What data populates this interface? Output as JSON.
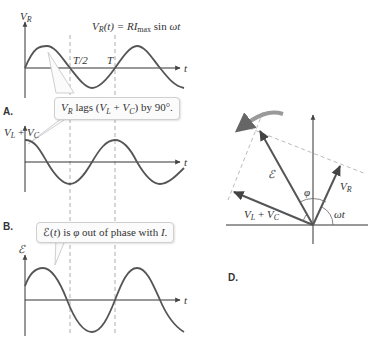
{
  "panels": {
    "A": {
      "label": "A.",
      "y_axis_label": "V_R",
      "equation": "V_R(t) = RI_max sin ωt",
      "tick_half_period": "T/2",
      "tick_period": "T",
      "x_axis_label": "t"
    },
    "B": {
      "label": "B.",
      "y_axis_label": "V_L + V_C",
      "x_axis_label": "t"
    },
    "C": {
      "y_axis_label": "ℰ",
      "x_axis_label": "t"
    },
    "D": {
      "label": "D.",
      "phasors": [
        "ℰ",
        "V_R",
        "V_L + V_C"
      ],
      "angle_labels": [
        "φ",
        "ωt"
      ]
    }
  },
  "callouts": {
    "lag_note": "V_R lags (V_L + V_C) by 90°.",
    "phase_note": "ℰ(t) is φ out of phase with I."
  },
  "colors": {
    "curve": "#555555",
    "axis": "#333333",
    "dashed": "#999999",
    "rotation_arrow": "#9a9a9a"
  }
}
